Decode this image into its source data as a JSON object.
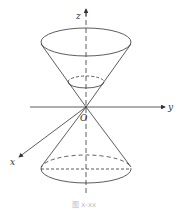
{
  "figure": {
    "labels": {
      "z_axis": "z",
      "y_axis": "y",
      "x_axis": "x",
      "origin": "O"
    },
    "caption": "图 x-xx",
    "colors": {
      "line": "#333333",
      "background": "#ffffff"
    }
  }
}
